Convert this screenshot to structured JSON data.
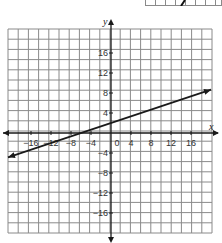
{
  "chart_data": {
    "type": "line",
    "title": "",
    "xlabel": "x",
    "ylabel": "y",
    "xlim": [
      -20.6,
      20.2
    ],
    "ylim": [
      -20,
      20.8
    ],
    "grid": true,
    "grid_step": 2,
    "x_ticks": [
      -16,
      -12,
      -8,
      -4,
      0,
      4,
      8,
      12,
      16
    ],
    "x_tick_labels": [
      "−16",
      "−12",
      "−8",
      "−4",
      "0",
      "4",
      "8",
      "12",
      "16"
    ],
    "y_ticks": [
      16,
      12,
      8,
      4,
      -4,
      -8,
      -12,
      -16
    ],
    "y_tick_labels": [
      "16",
      "12",
      "8",
      "4",
      "−4",
      "−8",
      "−12",
      "−16"
    ],
    "series": [
      {
        "name": "line",
        "equation": "y = (1/3)x + 2",
        "slope": 0.3333,
        "intercept": 2,
        "x": [
          -20.6,
          20
        ],
        "y": [
          -4.87,
          8.67
        ],
        "arrows": "both"
      }
    ],
    "colors": {
      "grid": "#8a8a8a",
      "axis": "#1a1a1a",
      "line": "#1a1a1a"
    }
  }
}
